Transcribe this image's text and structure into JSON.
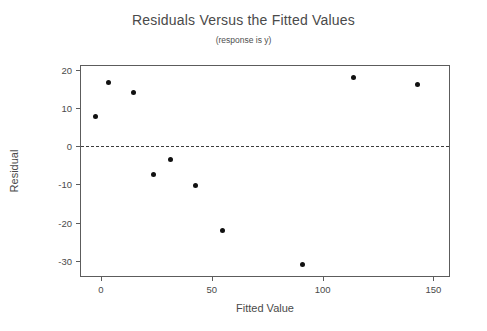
{
  "chart_data": {
    "type": "scatter",
    "title": "Residuals Versus the Fitted Values",
    "subtitle": "(response is y)",
    "xlabel": "Fitted Value",
    "ylabel": "Residual",
    "xlim": [
      -9,
      157
    ],
    "ylim": [
      -34,
      21
    ],
    "xticks": [
      0,
      50,
      100,
      150
    ],
    "xticklabels": [
      "0",
      "50",
      "100",
      "150"
    ],
    "yticks": [
      20,
      10,
      0,
      -10,
      -20,
      -30
    ],
    "yticklabels": [
      "20",
      "10",
      "0",
      "-10",
      "-20",
      "-30"
    ],
    "grid": false,
    "legend": null,
    "reference_line": {
      "type": "horizontal",
      "y": 0,
      "style": "dashed"
    },
    "marker": {
      "shape": "circle",
      "color": "#111111",
      "size": 5
    },
    "x": [
      -2.6,
      3.4,
      14.5,
      23.5,
      31.5,
      42.5,
      55.0,
      91.0,
      114.0,
      143.0
    ],
    "y": [
      7.7,
      16.8,
      14.0,
      -7.4,
      -3.6,
      -10.2,
      -22.2,
      -30.9,
      17.9,
      16.1
    ],
    "points": [
      {
        "x": -2.6,
        "y": 7.7
      },
      {
        "x": 3.4,
        "y": 16.8
      },
      {
        "x": 14.5,
        "y": 14.0
      },
      {
        "x": 23.5,
        "y": -7.4
      },
      {
        "x": 31.5,
        "y": -3.6
      },
      {
        "x": 42.5,
        "y": -10.2
      },
      {
        "x": 55.0,
        "y": -22.2
      },
      {
        "x": 91.0,
        "y": -30.9
      },
      {
        "x": 114.0,
        "y": 17.9
      },
      {
        "x": 143.0,
        "y": 16.1
      }
    ]
  }
}
